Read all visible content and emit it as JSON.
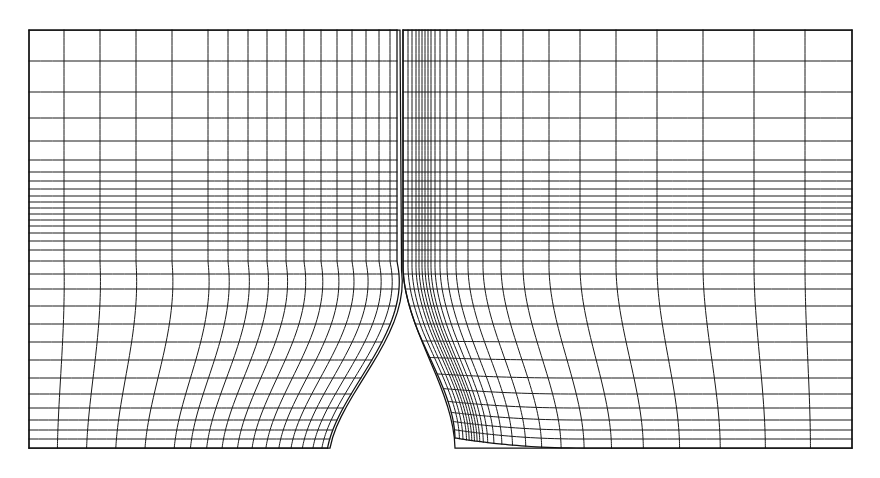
{
  "figure": {
    "kind": "computational-mesh",
    "background_color": "#ffffff",
    "line_color": "#1b1b1b",
    "line_width_px": 1,
    "canvas": {
      "width": 880,
      "height": 478
    }
  },
  "mesh_data": {
    "type": "structured-multiblock-grid",
    "domain": {
      "x_min": 29,
      "x_max": 852,
      "y_min": 30,
      "y_max": 448,
      "units": "pixels"
    },
    "blocks": [
      {
        "name": "left-block",
        "description": "Upstream body: rectangular region whose lower-right corner is cut by a curved concave ramp forming a wedge trailing edge",
        "x_range": [
          29,
          400
        ],
        "y_range": [
          30,
          448
        ],
        "i_lines": 29,
        "j_lines": 31
      },
      {
        "name": "right-block",
        "description": "Downstream body: rectangular region whose lower-left corner is cut by a curved concave leading edge",
        "x_range": [
          403,
          852
        ],
        "y_range": [
          30,
          448
        ],
        "i_lines": 27,
        "j_lines": 31
      }
    ],
    "gap": {
      "name": "central-passage",
      "description": "Open white channel separating the two blocks, narrowing toward the top",
      "top_x": 400,
      "bottom_left_x": 330,
      "bottom_right_x": 455,
      "y_start": 262,
      "y_end": 448
    },
    "clustering": {
      "x_cluster_center": 418,
      "x_cluster_description": "Vertical grid lines cluster tightly on both sides of the interface at x~400-440",
      "y_cluster_center": 205,
      "y_cluster_description": "Horizontal grid lines cluster in a dense band across the mid-height of the domain",
      "wall_normal_stretching": "geometric"
    },
    "x_stations_top": [
      29,
      64,
      100,
      136,
      172,
      208,
      228,
      248,
      267,
      286,
      304,
      321,
      337,
      352,
      366,
      379,
      390,
      397,
      403,
      408,
      412,
      416,
      419,
      422,
      425,
      428,
      431,
      435,
      440,
      447,
      456,
      468,
      483,
      501,
      523,
      549,
      580,
      616,
      657,
      703,
      754,
      805,
      852
    ],
    "y_stations_left": [
      30,
      61,
      92,
      118,
      141,
      160,
      172,
      181,
      189,
      196,
      202,
      208,
      214,
      220,
      226,
      233,
      241,
      250,
      261,
      274,
      289,
      306,
      324,
      342,
      360,
      378,
      394,
      408,
      420,
      430,
      439,
      448
    ],
    "features": [
      {
        "name": "upper-freestream-region",
        "note": "coarse cells, tall rows near the top edge"
      },
      {
        "name": "mid-shear-layer-band",
        "note": "finest horizontal spacing, ~12 tightly packed rows"
      },
      {
        "name": "left-wedge-ramp",
        "note": "concave curved cut from (330,448) up to (400,262)"
      },
      {
        "name": "right-leading-edge-ramp",
        "note": "concave curved cut from (403,262) down to (455,448)"
      },
      {
        "name": "outer-boundary",
        "note": "closed rectangular outline drawn with a slightly heavier stroke"
      }
    ]
  }
}
